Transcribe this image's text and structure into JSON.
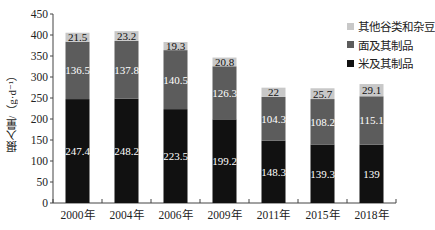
{
  "chart_data": {
    "type": "bar",
    "stacked": true,
    "title": "",
    "xlabel": "",
    "ylabel": "摄入量/（g·d⁻¹）",
    "ylim": [
      0,
      450
    ],
    "yticks": [
      0,
      50,
      100,
      150,
      200,
      250,
      300,
      350,
      400,
      450
    ],
    "grid": false,
    "legend_position": "top-right",
    "categories": [
      "2000年",
      "2004年",
      "2006年",
      "2009年",
      "2011年",
      "2015年",
      "2018年"
    ],
    "series": [
      {
        "name": "米及其制品",
        "color": "#111111",
        "label_color": "#ffffff",
        "values": [
          247.4,
          248.2,
          223.5,
          199.2,
          148.3,
          139.3,
          139
        ]
      },
      {
        "name": "面及其制品",
        "color": "#5c5c5c",
        "label_color": "#ffffff",
        "values": [
          136.5,
          137.8,
          140.5,
          126.3,
          104.3,
          108.2,
          115.1
        ]
      },
      {
        "name": "其他谷类和杂豆",
        "color": "#c8c8c8",
        "label_color": "#111111",
        "values": [
          21.5,
          23.2,
          19.3,
          20.8,
          22,
          25.7,
          29.1
        ]
      }
    ],
    "value_labels": [
      [
        "247.4",
        "248.2",
        "223.5",
        "199.2",
        "148.3",
        "139.3",
        "139"
      ],
      [
        "136.5",
        "137.8",
        "140.5",
        "126.3",
        "104.3",
        "108.2",
        "115.1"
      ],
      [
        "21.5",
        "23.2",
        "19.3",
        "20.8",
        "22",
        "25.7",
        "29.1"
      ]
    ]
  },
  "legend": {
    "items": [
      {
        "label": "其他谷类和杂豆",
        "color": "#c8c8c8"
      },
      {
        "label": "面及其制品",
        "color": "#5c5c5c"
      },
      {
        "label": "米及其制品",
        "color": "#111111"
      }
    ]
  },
  "axis": {
    "ylabel": "摄入量/（g·d⁻¹）"
  }
}
